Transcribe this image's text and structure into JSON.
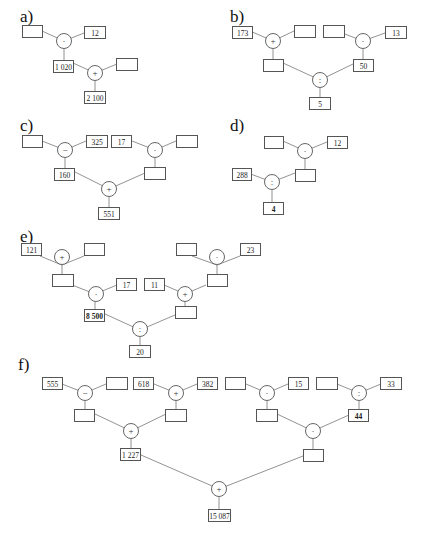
{
  "puzzles": {
    "a": {
      "label": "a)",
      "boxes": {
        "in1": "",
        "in2": "12",
        "mid": "1 020",
        "in3": "",
        "result": "2 100"
      },
      "ops": {
        "op1": "·",
        "op2": "+"
      }
    },
    "b": {
      "label": "b)",
      "boxes": {
        "l1": "173",
        "l2": "",
        "r1": "",
        "r2": "13",
        "lmid": "",
        "rmid": "50",
        "result": "5"
      },
      "ops": {
        "opl": "+",
        "opr": "·",
        "opm": ":"
      }
    },
    "c": {
      "label": "c)",
      "boxes": {
        "l1": "",
        "l2": "325",
        "r1": "17",
        "r2": "",
        "lmid": "160",
        "rmid": "",
        "result": "551"
      },
      "ops": {
        "opl": "−",
        "opr": "·",
        "opm": "+"
      }
    },
    "d": {
      "label": "d)",
      "boxes": {
        "t1": "",
        "t2": "12",
        "left": "288",
        "mid": "",
        "result": "4"
      },
      "ops": {
        "op1": "·",
        "op2": ":"
      }
    },
    "e": {
      "label": "e)",
      "boxes": {
        "a1": "121",
        "a2": "",
        "amid": "",
        "b2": "17",
        "bmid": "8 500",
        "c1": "",
        "c2": "23",
        "cmid": "",
        "d1": "11",
        "dmid": "",
        "result": "20"
      },
      "ops": {
        "opa": "+",
        "opb": "·",
        "opc": "·",
        "opd": "+",
        "opm": ":"
      }
    },
    "f": {
      "label": "f)",
      "boxes": {
        "a1": "555",
        "a2": "",
        "amid": "",
        "b1": "618",
        "b2": "382",
        "bmid": "",
        "lres": "1 227",
        "c1": "",
        "c2": "15",
        "cmid": "",
        "d1": "",
        "d2": "33",
        "dmid": "44",
        "rres": "",
        "result": "15 087"
      },
      "ops": {
        "opa": "−",
        "opb": "+",
        "opl": "+",
        "opc": "·",
        "opd": ":",
        "opr": "·",
        "opm": "+"
      }
    }
  }
}
